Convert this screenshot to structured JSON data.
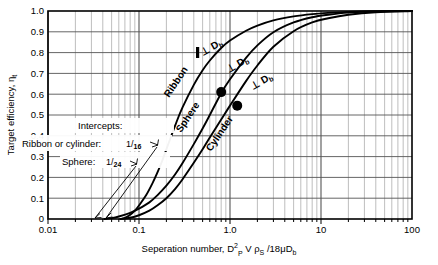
{
  "chart_data": {
    "type": "line",
    "title": "",
    "xlabel": "Seperation number, D²ₚ V ρₛ /18 μ Dᵇ",
    "xlabel_parts": {
      "lead": "Seperation number, D",
      "sup": "2",
      "sub1": "P",
      "mid": " V ",
      "rho": "ρ",
      "sub2": "S",
      "tail": " /18",
      "mu": "μ",
      "dterm": "D",
      "sub3": "b"
    },
    "ylabel": "Target efficiency, ηₜ",
    "ylabel_parts": {
      "lead": "Target efficiency, ",
      "eta": "η",
      "sub": "t"
    },
    "xscale": "log",
    "xlim": [
      0.01,
      100
    ],
    "ylim": [
      0,
      1.0
    ],
    "grid": "log-minor-and-major",
    "xticks": [
      "0.01",
      "0.1",
      "1.0",
      "10",
      "100"
    ],
    "xtick_values": [
      0.01,
      0.1,
      1,
      10,
      100
    ],
    "yticks": [
      "0",
      "0.1",
      "0.2",
      "0.3",
      "0.4",
      "0.5",
      "0.6",
      "0.7",
      "0.8",
      "0.9",
      "1.0"
    ],
    "ytick_values": [
      0,
      0.1,
      0.2,
      0.3,
      0.4,
      0.5,
      0.6,
      0.7,
      0.8,
      0.9,
      1.0
    ],
    "series": [
      {
        "name": "Ribbon",
        "label": "Ribbon",
        "shape_icon": "vertical-bar",
        "perp_note": "⊥ D",
        "perp_sub": "b",
        "intercept": 0.0625,
        "points": [
          [
            0.0625,
            0.0
          ],
          [
            0.07,
            0.005
          ],
          [
            0.08,
            0.02
          ],
          [
            0.09,
            0.04
          ],
          [
            0.1,
            0.065
          ],
          [
            0.12,
            0.115
          ],
          [
            0.14,
            0.17
          ],
          [
            0.16,
            0.225
          ],
          [
            0.18,
            0.28
          ],
          [
            0.2,
            0.335
          ],
          [
            0.25,
            0.45
          ],
          [
            0.3,
            0.535
          ],
          [
            0.4,
            0.645
          ],
          [
            0.5,
            0.715
          ],
          [
            0.6,
            0.762
          ],
          [
            0.8,
            0.822
          ],
          [
            1.0,
            0.858
          ],
          [
            1.5,
            0.905
          ],
          [
            2.0,
            0.93
          ],
          [
            3.0,
            0.955
          ],
          [
            5.0,
            0.974
          ],
          [
            8.0,
            0.985
          ],
          [
            12.0,
            0.991
          ],
          [
            20.0,
            0.996
          ],
          [
            40.0,
            0.999
          ],
          [
            100.0,
            1.0
          ]
        ]
      },
      {
        "name": "Sphere",
        "label": "Sphere",
        "shape_icon": "filled-circle",
        "perp_note": "⊥ D",
        "perp_sub": "b",
        "intercept": 0.041667,
        "marker": [
          0.8,
          0.61
        ],
        "points": [
          [
            0.0417,
            0.0
          ],
          [
            0.05,
            0.004
          ],
          [
            0.06,
            0.012
          ],
          [
            0.08,
            0.03
          ],
          [
            0.1,
            0.05
          ],
          [
            0.13,
            0.08
          ],
          [
            0.16,
            0.115
          ],
          [
            0.2,
            0.16
          ],
          [
            0.25,
            0.215
          ],
          [
            0.3,
            0.268
          ],
          [
            0.4,
            0.36
          ],
          [
            0.5,
            0.435
          ],
          [
            0.6,
            0.5
          ],
          [
            0.8,
            0.605
          ],
          [
            1.0,
            0.672
          ],
          [
            1.5,
            0.775
          ],
          [
            2.0,
            0.835
          ],
          [
            3.0,
            0.898
          ],
          [
            5.0,
            0.945
          ],
          [
            8.0,
            0.97
          ],
          [
            12.0,
            0.982
          ],
          [
            20.0,
            0.992
          ],
          [
            40.0,
            0.998
          ],
          [
            100.0,
            1.0
          ]
        ]
      },
      {
        "name": "Cylinder",
        "label": "Cylinder",
        "shape_icon": "filled-circle",
        "perp_note": "⊥ D",
        "perp_sub": "b",
        "intercept": 0.0625,
        "marker": [
          1.2,
          0.545
        ],
        "points": [
          [
            0.0625,
            0.0
          ],
          [
            0.08,
            0.006
          ],
          [
            0.1,
            0.018
          ],
          [
            0.13,
            0.04
          ],
          [
            0.16,
            0.066
          ],
          [
            0.2,
            0.1
          ],
          [
            0.25,
            0.145
          ],
          [
            0.3,
            0.19
          ],
          [
            0.4,
            0.27
          ],
          [
            0.5,
            0.335
          ],
          [
            0.6,
            0.392
          ],
          [
            0.8,
            0.478
          ],
          [
            1.0,
            0.545
          ],
          [
            1.5,
            0.663
          ],
          [
            2.0,
            0.738
          ],
          [
            3.0,
            0.828
          ],
          [
            5.0,
            0.903
          ],
          [
            8.0,
            0.945
          ],
          [
            12.0,
            0.965
          ],
          [
            20.0,
            0.982
          ],
          [
            40.0,
            0.994
          ],
          [
            100.0,
            1.0
          ]
        ]
      }
    ],
    "annotations": {
      "intercepts_heading": "Intercepts:",
      "ribbon_cylinder_label": "Ribbon or cylinder:",
      "ribbon_cylinder_num": "1",
      "ribbon_cylinder_den": "16",
      "sphere_label": "Sphere:",
      "sphere_num": "1",
      "sphere_den": "24"
    },
    "colors": {
      "curve": "#000000",
      "grid_major": "#555555",
      "grid_minor": "#9a9a9a",
      "frame": "#000000",
      "background": "#ffffff",
      "marker": "#000000"
    }
  }
}
